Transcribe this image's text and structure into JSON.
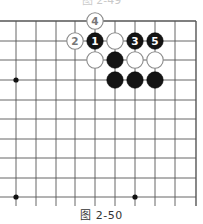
{
  "top_caption": "图 2-49",
  "caption": "图 2-50",
  "board": {
    "x_lines": [
      16,
      36,
      56,
      75,
      95,
      115,
      135,
      155,
      175,
      196
    ],
    "y_lines": [
      21,
      41,
      60,
      80,
      100,
      119,
      139,
      158,
      178,
      197
    ],
    "right_border_x": 196,
    "top_border_y": 21,
    "line_extend_bottom": 206,
    "line_extend_left": 0,
    "line_color": "#555555",
    "stone_radius": 8.2,
    "star_points": [
      {
        "col": 0,
        "row": 3
      },
      {
        "col": 0,
        "row": 9
      },
      {
        "col": 6,
        "row": 9
      }
    ],
    "stones": [
      {
        "color": "white",
        "col": 4,
        "row": 0,
        "label": "4"
      },
      {
        "color": "white",
        "col": 3,
        "row": 1,
        "label": "2"
      },
      {
        "color": "black",
        "col": 4,
        "row": 1,
        "label": "1"
      },
      {
        "color": "white",
        "col": 5,
        "row": 1,
        "label": ""
      },
      {
        "color": "black",
        "col": 6,
        "row": 1,
        "label": "3"
      },
      {
        "color": "black",
        "col": 7,
        "row": 1,
        "label": "5"
      },
      {
        "color": "white",
        "col": 4,
        "row": 2,
        "label": ""
      },
      {
        "color": "black",
        "col": 5,
        "row": 2,
        "label": ""
      },
      {
        "color": "white",
        "col": 6,
        "row": 2,
        "label": ""
      },
      {
        "color": "white",
        "col": 7,
        "row": 2,
        "label": ""
      },
      {
        "color": "black",
        "col": 5,
        "row": 3,
        "label": ""
      },
      {
        "color": "black",
        "col": 6,
        "row": 3,
        "label": ""
      },
      {
        "color": "black",
        "col": 7,
        "row": 3,
        "label": ""
      }
    ]
  }
}
